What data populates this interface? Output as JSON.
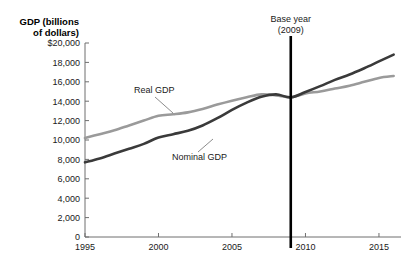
{
  "chart_data": {
    "type": "line",
    "title": "",
    "xlabel": "",
    "ylabel": "GDP (billions of dollars)",
    "xlim": [
      1995,
      2016.5
    ],
    "ylim": [
      0,
      20000
    ],
    "grid": false,
    "legend_position": "inline-annotations",
    "x_ticks": [
      "1995",
      "2000",
      "2005",
      "2010",
      "2015"
    ],
    "x_tick_values": [
      1995,
      2000,
      2005,
      2010,
      2015
    ],
    "y_ticks": [
      "0",
      "2,000",
      "4,000",
      "6,000",
      "8,000",
      "10,000",
      "12,000",
      "14,000",
      "16,000",
      "18,000",
      "$20,000"
    ],
    "y_tick_values": [
      0,
      2000,
      4000,
      6000,
      8000,
      10000,
      12000,
      14000,
      16000,
      18000,
      20000
    ],
    "x": [
      1995,
      1996,
      1997,
      1998,
      1999,
      2000,
      2001,
      2002,
      2003,
      2004,
      2005,
      2006,
      2007,
      2008,
      2009,
      2010,
      2011,
      2012,
      2013,
      2014,
      2015,
      2016
    ],
    "series": [
      {
        "name": "Real GDP",
        "color": "#9a9a9a",
        "values": [
          10200,
          10600,
          11000,
          11500,
          12000,
          12500,
          12650,
          12850,
          13200,
          13650,
          14050,
          14400,
          14700,
          14600,
          14400,
          14800,
          15000,
          15300,
          15600,
          16000,
          16400,
          16600
        ]
      },
      {
        "name": "Nominal GDP",
        "color": "#3a3a3a",
        "values": [
          7700,
          8100,
          8600,
          9100,
          9600,
          10250,
          10600,
          10950,
          11500,
          12250,
          13100,
          13850,
          14450,
          14700,
          14400,
          14950,
          15550,
          16200,
          16750,
          17400,
          18100,
          18800
        ]
      }
    ],
    "annotations": [
      {
        "id": "base-year",
        "text_line1": "Base year",
        "text_line2": "(2009)",
        "x_value": 2009,
        "type": "vertical-line"
      },
      {
        "id": "real-gdp-callout",
        "text": "Real GDP",
        "points_to_x": 2002.5,
        "points_to_y": 12800
      },
      {
        "id": "nominal-gdp-callout",
        "text": "Nominal GDP",
        "points_to_x": 2003.5,
        "points_to_y": 11500
      }
    ]
  },
  "axis": {
    "y_title_line1": "GDP (billions",
    "y_title_line2": "of dollars)",
    "y_labels": [
      "$20,000",
      "18,000",
      "16,000",
      "14,000",
      "12,000",
      "10,000",
      "8,000",
      "6,000",
      "4,000",
      "2,000",
      "0"
    ],
    "x_labels": [
      "1995",
      "2000",
      "2005",
      "2010",
      "2015"
    ]
  },
  "annotations": {
    "base_year_line1": "Base year",
    "base_year_line2": "(2009)",
    "real_gdp": "Real GDP",
    "nominal_gdp": "Nominal GDP"
  },
  "colors": {
    "real_gdp": "#9a9a9a",
    "nominal_gdp": "#3a3a3a",
    "axis": "#6f6f6f",
    "base_year_line": "#000000",
    "background": "#ffffff"
  }
}
